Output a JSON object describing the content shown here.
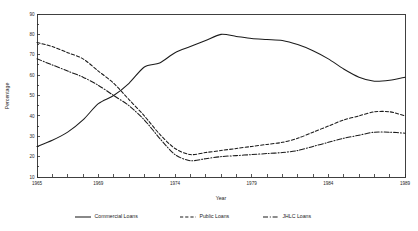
{
  "chart_data": {
    "type": "line",
    "title": "",
    "xlabel": "Year",
    "ylabel": "Percentage",
    "xlim": [
      1965,
      1989
    ],
    "ylim": [
      10,
      90
    ],
    "grid": false,
    "legend_position": "bottom",
    "x": [
      1965,
      1966,
      1967,
      1968,
      1969,
      1970,
      1971,
      1972,
      1973,
      1974,
      1975,
      1976,
      1977,
      1978,
      1979,
      1980,
      1981,
      1982,
      1983,
      1984,
      1985,
      1986,
      1987,
      1988,
      1989
    ],
    "x_tick_labels": [
      "1965",
      "1969",
      "1974",
      "1979",
      "1984",
      "1989"
    ],
    "x_tick_values": [
      1965,
      1969,
      1974,
      1979,
      1984,
      1989
    ],
    "y_tick_labels": [
      "10",
      "20",
      "30",
      "40",
      "50",
      "60",
      "70",
      "80",
      "90"
    ],
    "y_tick_values": [
      10,
      20,
      30,
      40,
      50,
      60,
      70,
      80,
      90
    ],
    "series": [
      {
        "name": "Commercial Loans",
        "style": "solid",
        "values": [
          25,
          28,
          32,
          38,
          46,
          50,
          56,
          64,
          66,
          71,
          74,
          77,
          80,
          79,
          78,
          77.5,
          77,
          75,
          72,
          68,
          63,
          59,
          57,
          57.5,
          59
        ]
      },
      {
        "name": "Public Loans",
        "style": "dashed",
        "values": [
          76,
          74,
          71,
          68,
          62,
          56,
          48,
          40,
          31,
          24,
          21,
          22,
          23,
          24,
          25,
          26,
          27,
          29,
          32,
          35,
          38,
          40,
          42,
          42,
          40
        ]
      },
      {
        "name": "JHLC Loans",
        "style": "dash-dot",
        "values": [
          68,
          65,
          62,
          59,
          55,
          50,
          45,
          38,
          29,
          21,
          18,
          19,
          20,
          20.5,
          21,
          21.5,
          22,
          23,
          25,
          27,
          29,
          30.5,
          32,
          32,
          31.5
        ]
      }
    ]
  },
  "legend": {
    "items": [
      {
        "label": "Commercial Loans",
        "style": "solid"
      },
      {
        "label": "Public Loans",
        "style": "dashed"
      },
      {
        "label": "JHLC Loans",
        "style": "dash-dot"
      }
    ]
  },
  "colors": {
    "axis": "#2b2b2b",
    "line": "#1b1b1b",
    "text": "#262626",
    "background": "#ffffff"
  }
}
